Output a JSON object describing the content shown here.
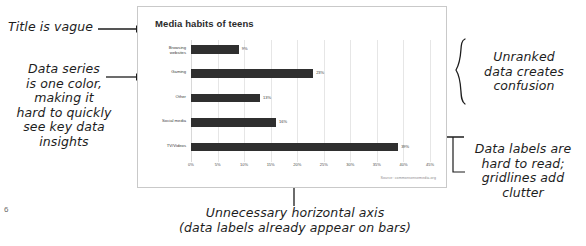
{
  "slide": {
    "page_number": "6",
    "chart": {
      "title": "Media habits of teens",
      "source": "Source: commonsensemedia.org"
    }
  },
  "chart_data": {
    "type": "bar",
    "orientation": "horizontal",
    "title": "Media habits of teens",
    "xlabel": "",
    "ylabel": "",
    "categories": [
      "Browsing websites",
      "Gaming",
      "Other",
      "Social media",
      "TV/Videos"
    ],
    "values": [
      9,
      23,
      13,
      16,
      39
    ],
    "value_labels": [
      "9%",
      "23%",
      "13%",
      "16%",
      "39%"
    ],
    "xlim": [
      0,
      45
    ],
    "xticks": [
      0,
      5,
      10,
      15,
      20,
      25,
      30,
      35,
      40,
      45
    ],
    "xtick_labels": [
      "0%",
      "5%",
      "10%",
      "15%",
      "20%",
      "25%",
      "30%",
      "35%",
      "40%",
      "45%"
    ],
    "grid": true,
    "legend": "none",
    "series_color": "#2f2f2f"
  },
  "annotations": {
    "title_vague": "Title is vague",
    "data_series": "Data series\nis one color,\nmaking it\nhard to quickly\nsee key data\ninsights",
    "unranked": "Unranked\ndata creates\nconfusion",
    "data_labels": "Data labels are\nhard to read;\ngridlines add\nclutter",
    "axis": "Unnecessary horizontal axis\n(data labels already appear on bars)"
  }
}
